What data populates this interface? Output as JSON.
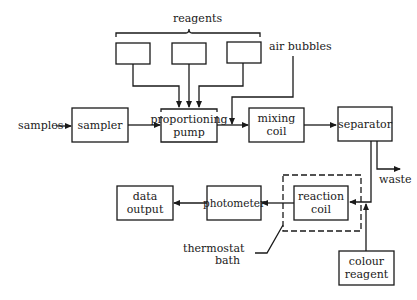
{
  "diagram": {
    "type": "flow",
    "title": "",
    "labels": {
      "reagents": "reagents",
      "air_bubbles": "air bubbles",
      "samples": "samples",
      "waste": "waste",
      "thermostat_bath_line1": "thermostat",
      "thermostat_bath_line2": "bath"
    },
    "nodes": {
      "reagent_1": {
        "label": ""
      },
      "reagent_2": {
        "label": ""
      },
      "reagent_3": {
        "label": ""
      },
      "sampler": {
        "label": "sampler"
      },
      "proportioning_pump": {
        "line1": "proportioning",
        "line2": "pump"
      },
      "mixing_coil": {
        "line1": "mixing",
        "line2": "coil"
      },
      "separator": {
        "label": "separator"
      },
      "reaction_coil": {
        "line1": "reaction",
        "line2": "coil"
      },
      "photometer": {
        "label": "photometer"
      },
      "data_output": {
        "line1": "data",
        "line2": "output"
      },
      "colour_reagent": {
        "line1": "colour",
        "line2": "reagent"
      }
    },
    "edges": [
      {
        "from": "samples",
        "to": "sampler"
      },
      {
        "from": "sampler",
        "to": "proportioning_pump"
      },
      {
        "from": "reagent_1",
        "to": "proportioning_pump"
      },
      {
        "from": "reagent_2",
        "to": "proportioning_pump"
      },
      {
        "from": "reagent_3",
        "to": "proportioning_pump"
      },
      {
        "from": "proportioning_pump",
        "to": "mixing_coil"
      },
      {
        "from": "air_bubbles",
        "to": "mixing_coil"
      },
      {
        "from": "mixing_coil",
        "to": "separator"
      },
      {
        "from": "separator",
        "to": "waste"
      },
      {
        "from": "separator",
        "to": "reaction_coil"
      },
      {
        "from": "colour_reagent",
        "to": "reaction_coil"
      },
      {
        "from": "reaction_coil",
        "to": "photometer"
      },
      {
        "from": "photometer",
        "to": "data_output"
      }
    ],
    "groups": [
      {
        "name": "thermostat_bath",
        "contains": [
          "reaction_coil"
        ],
        "style": "dashed"
      }
    ]
  }
}
